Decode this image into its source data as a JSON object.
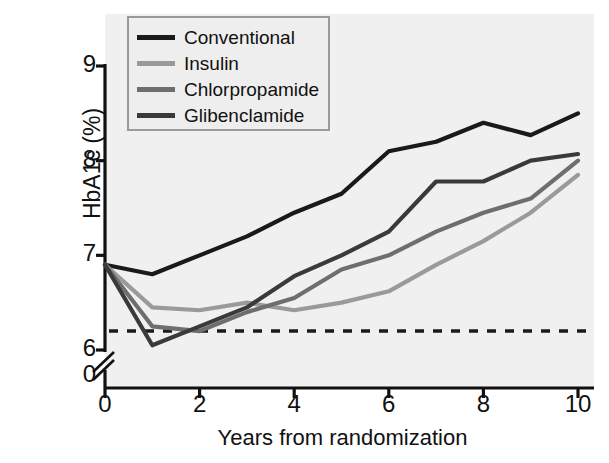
{
  "chart_data": {
    "type": "line",
    "title": "",
    "xlabel": "Years from randomization",
    "ylabel": "HbA1c (%)",
    "xlim": [
      0,
      10
    ],
    "ylim": [
      6,
      9
    ],
    "xticks": [
      "0",
      "2",
      "4",
      "6",
      "8",
      "10"
    ],
    "yticks": [
      "9",
      "8",
      "7",
      "6"
    ],
    "y_axis_break": true,
    "y_axis_break_label": "0",
    "grid": false,
    "legend_position": "top-left",
    "background": "#f0f0f0",
    "x": [
      0,
      1,
      2,
      3,
      4,
      5,
      6,
      7,
      8,
      9,
      10
    ],
    "reference_line": {
      "label": "",
      "value": 6.2,
      "style": "dashed",
      "color": "#1a1a1a"
    },
    "series": [
      {
        "name": "Conventional",
        "color": "#1a1a1a",
        "values": [
          6.9,
          6.8,
          7.0,
          7.2,
          7.45,
          7.65,
          8.1,
          8.2,
          8.4,
          8.27,
          8.5
        ]
      },
      {
        "name": "Insulin",
        "color": "#9a9a9a",
        "values": [
          6.9,
          6.45,
          6.42,
          6.5,
          6.42,
          6.5,
          6.62,
          6.9,
          7.15,
          7.45,
          7.85
        ]
      },
      {
        "name": "Chlorpropamide",
        "color": "#6e6e6e",
        "values": [
          6.9,
          6.25,
          6.2,
          6.4,
          6.55,
          6.85,
          7.0,
          7.25,
          7.45,
          7.6,
          8.0
        ]
      },
      {
        "name": "Glibenclamide",
        "color": "#3a3a3a",
        "values": [
          6.9,
          6.05,
          6.25,
          6.45,
          6.78,
          7.0,
          7.25,
          7.78,
          7.78,
          8.0,
          8.07
        ]
      }
    ]
  },
  "axis": {
    "y_title": "HbA1c (%)",
    "x_title": "Years from randomization"
  }
}
